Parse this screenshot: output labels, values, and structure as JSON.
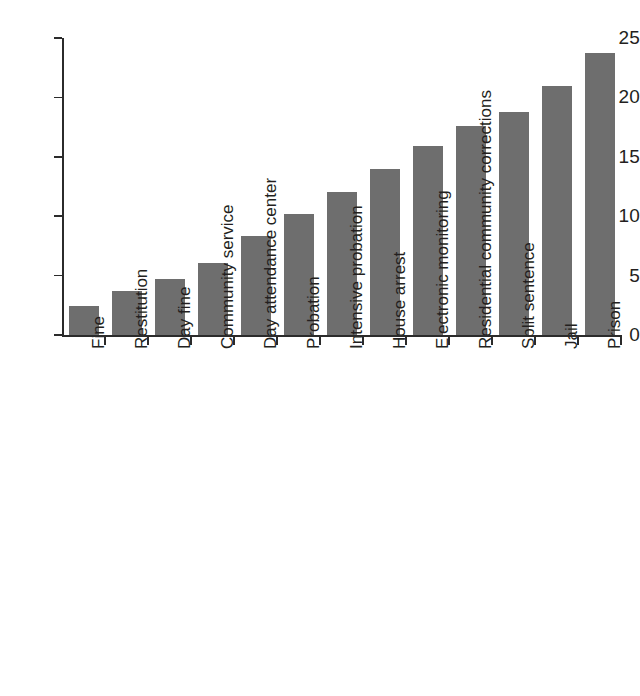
{
  "chart_data": {
    "type": "bar",
    "title": "",
    "subtitle": "",
    "xlabel": "",
    "ylabel": "",
    "ylim": [
      0,
      25
    ],
    "yticks": [
      0,
      5,
      10,
      15,
      20,
      25
    ],
    "ytick_labels": [
      "0",
      "5",
      "10",
      "15",
      "20",
      "25"
    ],
    "grid": false,
    "legend": null,
    "bar_color": "#6e6e6e",
    "axis_color": "#2b2b2b",
    "text_color": "#231f20",
    "xtick_label_rotation": -90,
    "categories": [
      "Fine",
      "Restitution",
      "Day fine",
      "Community service",
      "Day attendance center",
      "Probation",
      "Intensive probation",
      "House arrest",
      "Electronic monitoring",
      "Residential community corrections",
      "Split sentence",
      "Jail",
      "Prison"
    ],
    "values": [
      2.4,
      3.7,
      4.7,
      6.1,
      8.3,
      10.2,
      12.0,
      14.0,
      15.9,
      17.6,
      18.8,
      21.0,
      23.7
    ]
  }
}
